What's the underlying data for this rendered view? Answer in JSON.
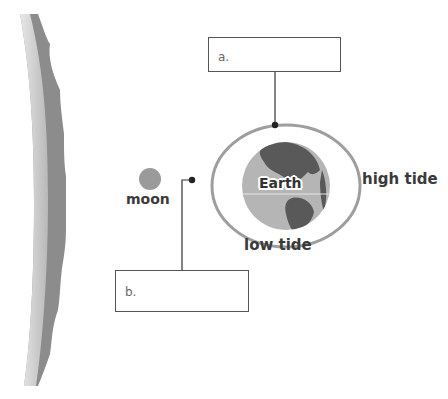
{
  "diagram": {
    "labels": {
      "moon": "moon",
      "earth": "Earth",
      "high_tide": "high tide",
      "low_tide": "low tide"
    },
    "answer_boxes": [
      {
        "id": "a",
        "letter": "a.",
        "value": ""
      },
      {
        "id": "b",
        "letter": "b.",
        "value": ""
      }
    ],
    "colors": {
      "sun_edge_dark": "#8c8c8c",
      "sun_edge_light": "#c8c8c8",
      "moon": "#9a9a9a",
      "ocean": "#b5b5b5",
      "land": "#595959",
      "tidal_bulge": "#9e9e9e",
      "leader_line": "#333333"
    }
  }
}
